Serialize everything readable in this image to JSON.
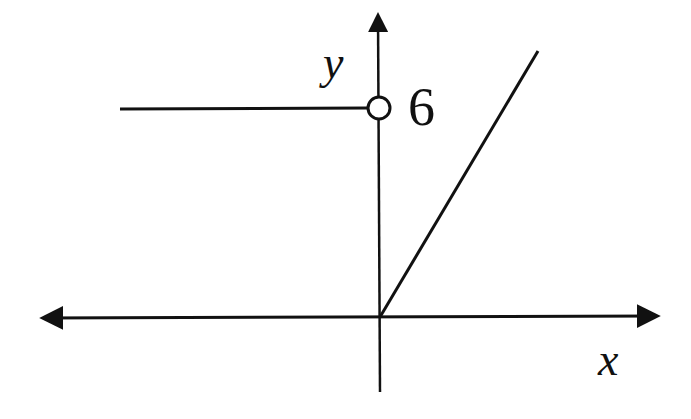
{
  "diagram": {
    "type": "piecewise-function-graph",
    "axes": {
      "x_label": "x",
      "y_label": "y"
    },
    "annotations": {
      "y_value_label": "6"
    },
    "pieces": [
      {
        "description": "horizontal ray y = 6 for x < 0",
        "endpoint": "open circle at (0, 6)"
      },
      {
        "description": "ray from origin with positive slope for x >= 0",
        "endpoint": "closed at (0, 0)"
      }
    ],
    "colors": {
      "stroke": "#111111",
      "background": "#ffffff"
    }
  }
}
